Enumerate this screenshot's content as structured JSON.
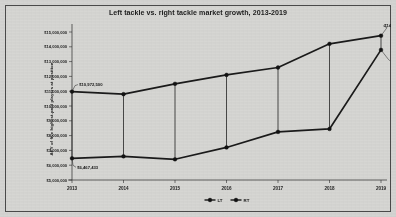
{
  "chart_data": {
    "type": "line",
    "title": "Left tackle vs. right tackle market growth, 2013-2019",
    "xlabel": "",
    "ylabel": "APY of five highest-paid players at position",
    "categories": [
      "2013",
      "2014",
      "2015",
      "2016",
      "2017",
      "2018",
      "2019"
    ],
    "x": [
      2013,
      2014,
      2015,
      2016,
      2017,
      2018,
      2019
    ],
    "ylim": [
      5000000,
      15000000
    ],
    "ytick_values": [
      5000000,
      6000000,
      7000000,
      8000000,
      9000000,
      10000000,
      11000000,
      12000000,
      13000000,
      14000000,
      15000000
    ],
    "ytick_labels": [
      "$5,000,000",
      "$6,000,000",
      "$7,000,000",
      "$8,000,000",
      "$9,000,000",
      "$10,000,000",
      "$11,000,000",
      "$12,000,000",
      "$13,000,000",
      "$14,000,000",
      "$15,000,000"
    ],
    "grid": false,
    "legend_position": "bottom",
    "series": [
      {
        "name": "LT",
        "values": [
          10972500,
          10800000,
          11500000,
          12100000,
          12600000,
          14200000,
          14750000
        ]
      },
      {
        "name": "RT",
        "values": [
          6467433,
          6600000,
          6400000,
          7200000,
          8250000,
          8450000,
          13791000
        ]
      }
    ],
    "annotations": [
      {
        "text": "$10,972,500",
        "series": "LT",
        "category": "2013"
      },
      {
        "text": "$14,750,000",
        "series": "LT",
        "category": "2019"
      },
      {
        "text": "$6,467,433",
        "series": "RT",
        "category": "2013"
      },
      {
        "text": "$13,791,000",
        "series": "RT",
        "category": "2019"
      }
    ],
    "colors": {
      "line": "#1a1a1a",
      "marker": "#121212",
      "background": "#d6d6d3",
      "axis": "#2a2a2a"
    }
  },
  "legend": {
    "entries": [
      {
        "label": "LT"
      },
      {
        "label": "RT"
      }
    ]
  }
}
